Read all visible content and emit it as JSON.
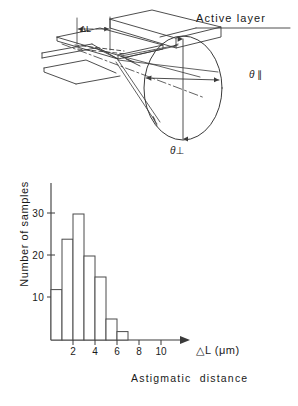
{
  "figure": {
    "schematic": {
      "active_layer_label": "Active layer",
      "delta_l_label": "ΔL",
      "theta_parallel_label": "θ ∥",
      "theta_perpendicular_label": "θ⊥"
    }
  },
  "chart_data": {
    "type": "bar",
    "title": "",
    "subtitle": "",
    "xlabel": "△L (μm)",
    "xcaption": "Astigmatic  distance",
    "ylabel": "Number of samples",
    "categories": [
      "0-1",
      "1-2",
      "2-3",
      "3-4",
      "4-5",
      "5-6",
      "6-7"
    ],
    "bin_edges": [
      0,
      1,
      2,
      3,
      4,
      5,
      6,
      7
    ],
    "values": [
      12,
      24,
      30,
      20,
      15,
      5,
      2
    ],
    "xlim": [
      0,
      11
    ],
    "ylim": [
      0,
      34
    ],
    "xticks": [
      2,
      4,
      6,
      8,
      10
    ],
    "xtick_labels": [
      "2",
      "4",
      "6",
      "8",
      "10"
    ],
    "yticks": [
      10,
      20,
      30
    ],
    "ytick_labels": [
      "10",
      "20",
      "30"
    ],
    "grid": false,
    "legend": "none",
    "bar_fill": "#ffffff",
    "bar_stroke": "#4a4a4a",
    "axis_color": "#3a3a3a"
  }
}
